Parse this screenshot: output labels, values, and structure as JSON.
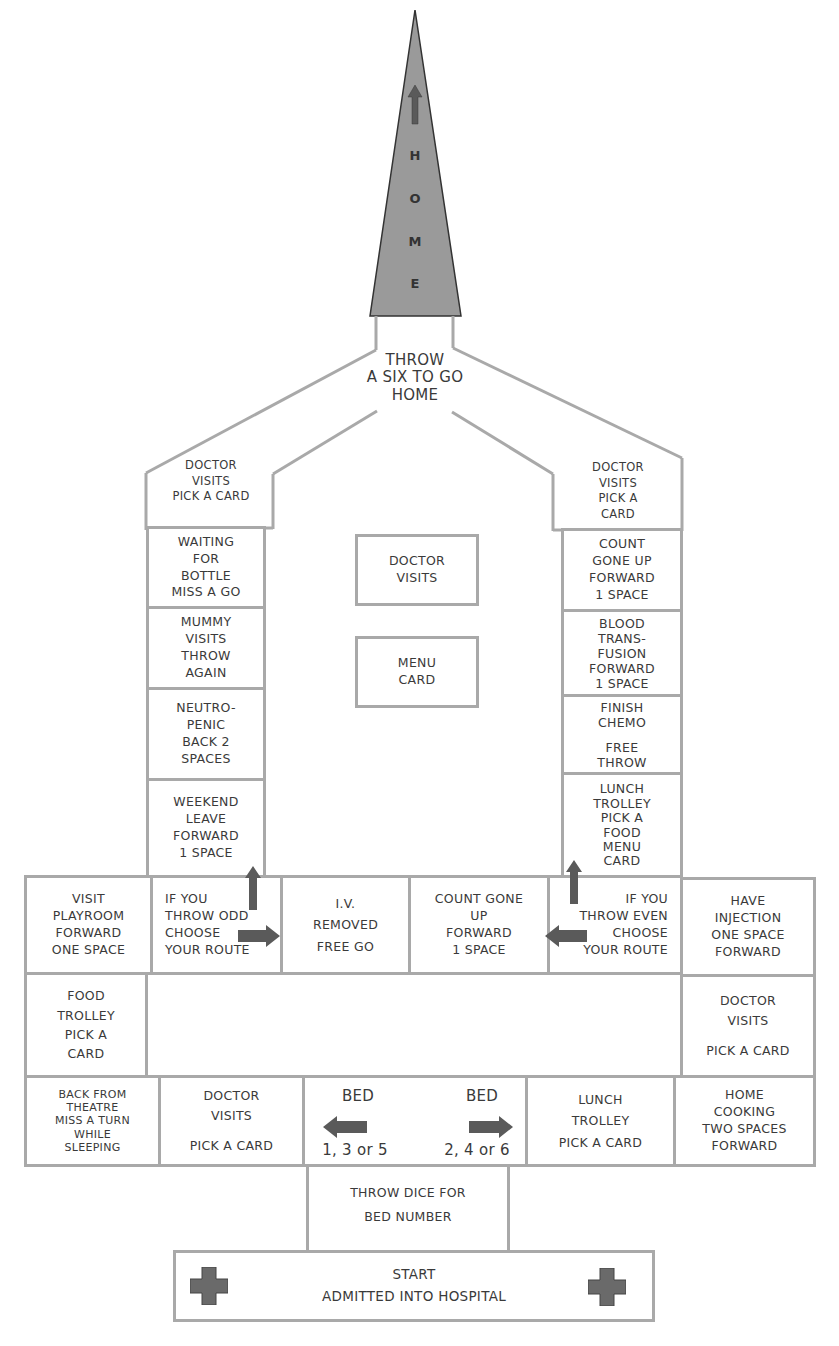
{
  "colors": {
    "line": "#a9a9a9",
    "spire_fill": "#9a9a9a",
    "arrow_fill": "#5a5a5a",
    "text": "#3a3a3a",
    "background": "#ffffff"
  },
  "spire": {
    "letters": [
      "H",
      "O",
      "M",
      "E"
    ],
    "arrow_icon": "up-arrow"
  },
  "go_home": {
    "lines": [
      "THROW",
      "A SIX TO GO",
      "HOME"
    ]
  },
  "left_column": [
    {
      "lines": [
        "DOCTOR",
        "VISITS",
        "PICK A CARD"
      ]
    },
    {
      "lines": [
        "WAITING",
        "FOR",
        "BOTTLE",
        "MISS A GO"
      ]
    },
    {
      "lines": [
        "MUMMY",
        "VISITS",
        "THROW",
        "AGAIN"
      ]
    },
    {
      "lines": [
        "NEUTRO-",
        "PENIC",
        "BACK 2",
        "SPACES"
      ]
    },
    {
      "lines": [
        "WEEKEND",
        "LEAVE",
        "FORWARD",
        "1 SPACE"
      ]
    }
  ],
  "right_column": [
    {
      "lines": [
        "DOCTOR",
        "VISITS",
        "PICK A",
        "CARD"
      ]
    },
    {
      "lines": [
        "COUNT",
        "GONE UP",
        "FORWARD",
        "1 SPACE"
      ]
    },
    {
      "lines": [
        "BLOOD",
        "TRANS-",
        "FUSION",
        "FORWARD",
        "1 SPACE"
      ]
    },
    {
      "lines": [
        "FINISH",
        "CHEMO",
        "",
        "FREE",
        "THROW"
      ]
    },
    {
      "lines": [
        "LUNCH",
        "TROLLEY",
        "PICK A",
        "FOOD",
        "MENU",
        "CARD"
      ]
    }
  ],
  "card_piles": [
    {
      "lines": [
        "DOCTOR",
        "VISITS"
      ]
    },
    {
      "lines": [
        "MENU",
        "CARD"
      ]
    }
  ],
  "middle_row": [
    {
      "lines": [
        "VISIT",
        "PLAYROOM",
        "FORWARD",
        "ONE SPACE"
      ]
    },
    {
      "lines": [
        "IF YOU",
        "THROW ODD",
        "CHOOSE",
        "YOUR ROUTE"
      ]
    },
    {
      "lines": [
        "I.V.",
        "REMOVED",
        "FREE GO"
      ]
    },
    {
      "lines": [
        "COUNT GONE",
        "UP",
        "FORWARD",
        "1 SPACE"
      ]
    },
    {
      "lines": [
        "IF YOU",
        "THROW EVEN",
        "CHOOSE",
        "YOUR ROUTE"
      ]
    },
    {
      "lines": [
        "HAVE",
        "INJECTION",
        "ONE SPACE",
        "FORWARD"
      ]
    }
  ],
  "side_cells": {
    "left": {
      "lines": [
        "FOOD",
        "TROLLEY",
        "PICK A",
        "CARD"
      ]
    },
    "right": {
      "lines": [
        "DOCTOR",
        "VISITS",
        "",
        "PICK A CARD"
      ]
    }
  },
  "bottom_row": [
    {
      "lines": [
        "BACK FROM",
        "THEATRE",
        "MISS A TURN",
        "WHILE",
        "SLEEPING"
      ]
    },
    {
      "lines": [
        "DOCTOR",
        "VISITS",
        "",
        "PICK A CARD"
      ]
    },
    {
      "bed_left": {
        "label": "BED",
        "numbers": "1, 3 or 5"
      },
      "bed_right": {
        "label": "BED",
        "numbers": "2, 4 or 6"
      }
    },
    {
      "lines": [
        "LUNCH",
        "TROLLEY",
        "PICK A CARD"
      ]
    },
    {
      "lines": [
        "HOME",
        "COOKING",
        "TWO SPACES",
        "FORWARD"
      ]
    }
  ],
  "dice_cell": {
    "lines": [
      "THROW DICE FOR",
      "BED NUMBER"
    ]
  },
  "start_cell": {
    "lines": [
      "START",
      "ADMITTED INTO HOSPITAL"
    ],
    "icons": [
      "cross-icon",
      "cross-icon"
    ]
  }
}
